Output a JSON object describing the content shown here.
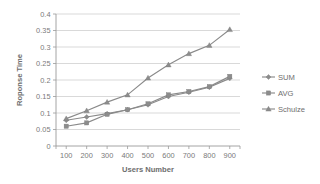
{
  "chart_data": {
    "type": "line",
    "title": "",
    "subtitle": "",
    "xlabel": "Users Number",
    "ylabel": "Roponse Time",
    "x": [
      100,
      200,
      300,
      400,
      500,
      600,
      700,
      800,
      900
    ],
    "categories": [
      "100",
      "200",
      "300",
      "400",
      "500",
      "600",
      "700",
      "800",
      "900"
    ],
    "xtick_labels": [
      "100",
      "200",
      "300",
      "400",
      "500",
      "600",
      "700",
      "800",
      "900"
    ],
    "ytick_labels": [
      "0",
      "0.05",
      "0.1",
      "0.15",
      "0.2",
      "0.25",
      "0.3",
      "0.35",
      "0.4"
    ],
    "ytick_values": [
      0,
      0.05,
      0.1,
      0.15,
      0.2,
      0.25,
      0.3,
      0.35,
      0.4
    ],
    "xlim": [
      50,
      950
    ],
    "ylim": [
      0,
      0.4
    ],
    "grid": "horizontal",
    "legend_position": "right",
    "series": [
      {
        "name": "SUM",
        "marker": "diamond",
        "color": "#8a8a8a",
        "values": [
          0.078,
          0.088,
          0.098,
          0.11,
          0.125,
          0.15,
          0.163,
          0.178,
          0.205
        ]
      },
      {
        "name": "AVG",
        "marker": "square",
        "color": "#8a8a8a",
        "values": [
          0.06,
          0.07,
          0.096,
          0.11,
          0.128,
          0.155,
          0.165,
          0.18,
          0.211
        ]
      },
      {
        "name": "Schulze",
        "marker": "triangle",
        "color": "#8a8a8a",
        "values": [
          0.083,
          0.107,
          0.133,
          0.155,
          0.206,
          0.246,
          0.28,
          0.305,
          0.353
        ]
      }
    ]
  },
  "legend": {
    "items": [
      {
        "label": "SUM",
        "marker": "diamond"
      },
      {
        "label": "AVG",
        "marker": "square"
      },
      {
        "label": "Schulze",
        "marker": "triangle"
      }
    ]
  },
  "axes": {
    "x_title": "Users Number",
    "y_title": "Roponse Time"
  },
  "colors": {
    "series": "#8a8a8a",
    "grid": "#c9c9c9",
    "axis": "#9a9a9a",
    "text": "#7a7a7a",
    "background": "#ffffff"
  }
}
